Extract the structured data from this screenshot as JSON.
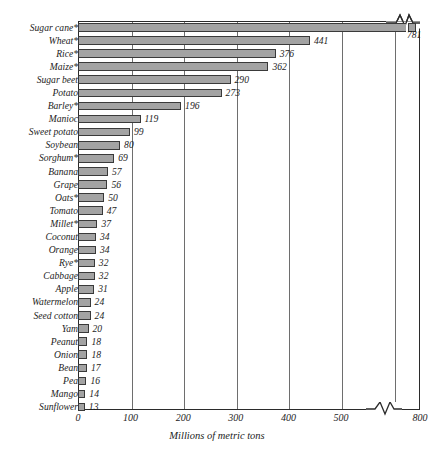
{
  "chart_data": {
    "type": "bar",
    "orientation": "horizontal",
    "title": "",
    "xlabel": "Millions of metric tons",
    "ylabel": "",
    "xlim": [
      0,
      800
    ],
    "xticks": [
      0,
      100,
      200,
      300,
      400,
      500,
      800
    ],
    "xtick_labels": [
      "0",
      "100",
      "200",
      "300",
      "400",
      "500",
      "800"
    ],
    "axis_break": {
      "present": true,
      "after_value": 500,
      "resumes_at": 800,
      "note": "zigzag break between 500 and 800"
    },
    "grid": "vertical",
    "legend": "none",
    "footnote_marker": "*",
    "categories": [
      "Sugar cane*",
      "Wheat*",
      "Rice*",
      "Maize*",
      "Sugar beet",
      "Potato",
      "Barley*",
      "Manioc",
      "Sweet potato",
      "Soybean",
      "Sorghum*",
      "Banana",
      "Grape",
      "Oats*",
      "Tomato",
      "Millet*",
      "Coconut",
      "Orange",
      "Rye*",
      "Cabbage",
      "Apple",
      "Watermelon",
      "Seed cotton",
      "Yam",
      "Peanut",
      "Onion",
      "Bean",
      "Pea",
      "Mango",
      "Sunflower"
    ],
    "values": [
      781,
      441,
      376,
      362,
      290,
      273,
      196,
      119,
      99,
      80,
      69,
      57,
      56,
      50,
      47,
      37,
      34,
      34,
      32,
      32,
      31,
      24,
      24,
      20,
      18,
      18,
      17,
      16,
      14,
      13
    ],
    "value_labels": [
      "781",
      "441",
      "376",
      "362",
      "290",
      "273",
      "196",
      "119",
      "99",
      "80",
      "69",
      "57",
      "56",
      "50",
      "47",
      "37",
      "34",
      "34",
      "32",
      "32",
      "31",
      "24",
      "24",
      "20",
      "18",
      "18",
      "17",
      "16",
      "14",
      "13"
    ],
    "bar_color": "#a3a3a3",
    "bar_border_color": "#3a3a3a",
    "grid_color": "#6e6e6e",
    "axis_color": "#2b2b2b",
    "text_color": "#1d1d1d"
  }
}
